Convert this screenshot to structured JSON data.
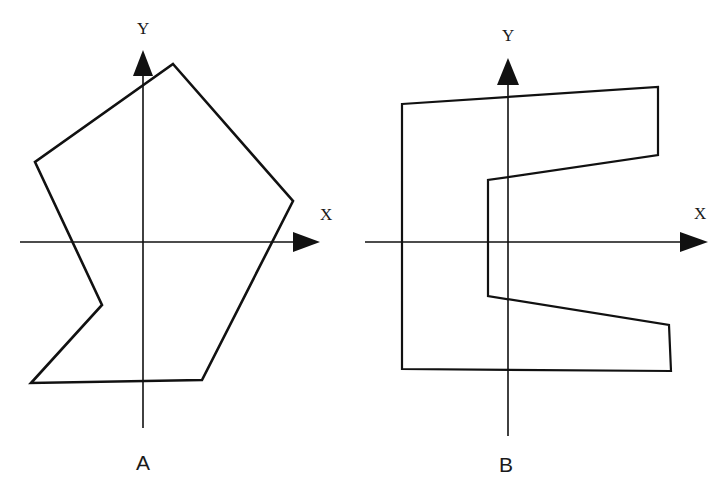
{
  "figure": {
    "panels": [
      {
        "id": "A",
        "label": "A",
        "axes": {
          "x_label": "X",
          "y_label": "Y"
        },
        "shape": "irregular hexagon (concave)",
        "vertices_px": [
          [
            173,
            64
          ],
          [
            293,
            201
          ],
          [
            202,
            380
          ],
          [
            31,
            383
          ],
          [
            102,
            305
          ],
          [
            35,
            162
          ]
        ]
      },
      {
        "id": "B",
        "label": "B",
        "axes": {
          "x_label": "X",
          "y_label": "Y"
        },
        "shape": "E-shaped / C-shaped concave octagon",
        "vertices_px": [
          [
            402,
            104
          ],
          [
            658,
            87
          ],
          [
            658,
            155
          ],
          [
            488,
            180
          ],
          [
            488,
            296
          ],
          [
            669,
            325
          ],
          [
            671,
            371
          ],
          [
            402,
            369
          ]
        ]
      }
    ],
    "colors": {
      "stroke": "#111111",
      "background": "#ffffff"
    }
  }
}
